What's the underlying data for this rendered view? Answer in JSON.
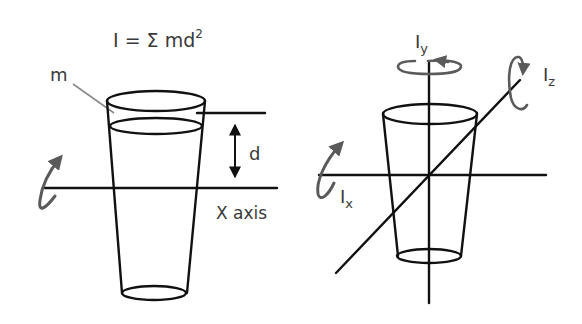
{
  "formula": {
    "main": "I = Σ md",
    "superscript": "2"
  },
  "left_panel": {
    "mass_label": "m",
    "distance_label": "d",
    "axis_label": "X axis"
  },
  "right_panel": {
    "axis_y": {
      "base": "I",
      "sub": "y"
    },
    "axis_z": {
      "base": "I",
      "sub": "z"
    },
    "axis_x": {
      "base": "I",
      "sub": "x"
    }
  },
  "colors": {
    "ink": "#111111",
    "rotation_arrow": "#5a5a5a",
    "text": "#3a3a3a",
    "background": "#ffffff"
  }
}
